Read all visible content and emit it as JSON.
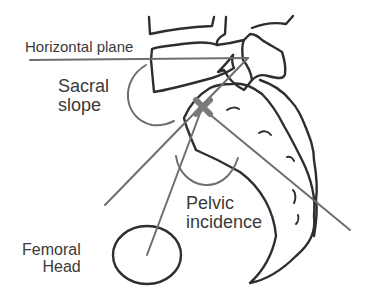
{
  "diagram": {
    "type": "anatomical-diagram",
    "labels": {
      "horizontal_plane": "Horizontal plane",
      "sacral_slope_line1": "Sacral",
      "sacral_slope_line2": "slope",
      "pelvic_incidence_line1": "Pelvic",
      "pelvic_incidence_line2": "incidence",
      "femoral_head_line1": "Femoral",
      "femoral_head_line2": "Head"
    },
    "colors": {
      "outline": "#2e2e2e",
      "reference_lines": "#6e6e6e",
      "center_marker": "#7a7a7a",
      "text": "#3a3a3a"
    }
  }
}
